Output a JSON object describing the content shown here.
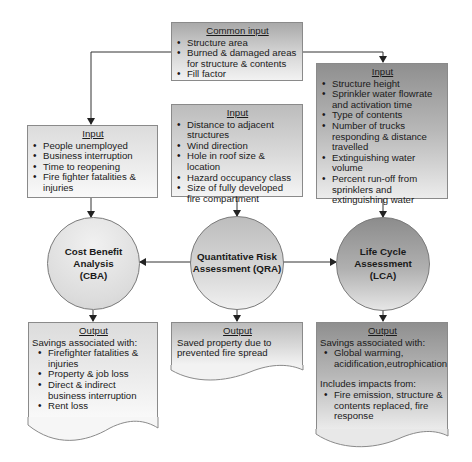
{
  "common_input": {
    "title": "Common input",
    "items": [
      "Structure area",
      "Burned & damaged areas for structure & contents",
      "Fill factor"
    ]
  },
  "cba_input": {
    "title": "Input",
    "items": [
      "People unemployed",
      "Business interruption",
      "Time to reopening",
      "Fire fighter fatalities & injuries"
    ]
  },
  "qra_input": {
    "title": "Input",
    "items": [
      "Distance to adjacent structures",
      "Wind direction",
      "Hole in roof size & location",
      "Hazard occupancy class",
      "Size of fully developed fire compartment"
    ]
  },
  "lca_input": {
    "title": "Input",
    "items": [
      "Structure height",
      "Sprinkler water flowrate and activation time",
      "Type of contents",
      "Number of trucks responding & distance travelled",
      "Extinguishing water volume",
      "Percent run-off from sprinklers and extinguishing water"
    ]
  },
  "nodes": {
    "cba": "Cost Benefit Analysis (CBA)",
    "qra": "Quantitative Risk Assessment (QRA)",
    "lca": "Life Cycle Assessment (LCA)"
  },
  "cba_output": {
    "title": "Output",
    "intro": "Savings associated with:",
    "items": [
      "Firefighter fatalities & injuries",
      "Property & job loss",
      "Direct & indirect business interruption",
      "Rent loss"
    ]
  },
  "qra_output": {
    "title": "Output",
    "text": "Saved property due to prevented fire spread"
  },
  "lca_output": {
    "title": "Output",
    "intro": "Savings associated with:",
    "items": [
      "Global warming, acidification,eutrophication"
    ],
    "intro2": "Includes impacts from:",
    "items2": [
      "Fire emission, structure & contents replaced, fire response"
    ]
  }
}
